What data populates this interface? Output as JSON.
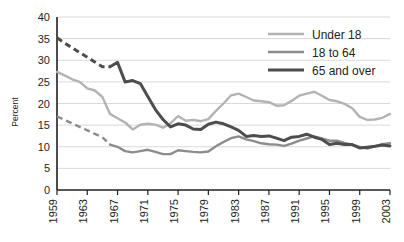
{
  "chart_data": {
    "type": "line",
    "title": "",
    "subtitle": "",
    "xlabel": "",
    "ylabel": "Percent",
    "ylim": [
      0,
      40
    ],
    "ytick_values": [
      0,
      5,
      10,
      15,
      20,
      25,
      30,
      35,
      40
    ],
    "ytick_labels": [
      "0",
      "5",
      "10",
      "15",
      "20",
      "25",
      "30",
      "35",
      "40"
    ],
    "xlim": [
      1959,
      2003
    ],
    "xtick_labels": [
      "1959",
      "1963",
      "1967",
      "1971",
      "1975",
      "1979",
      "1983",
      "1987",
      "1991",
      "1995",
      "1999",
      "2003"
    ],
    "xtick_values": [
      1959,
      1963,
      1967,
      1971,
      1975,
      1979,
      1983,
      1987,
      1991,
      1995,
      1999,
      2003
    ],
    "grid": "horizontal",
    "legend_position": "top-right",
    "x": [
      1959,
      1960,
      1961,
      1962,
      1963,
      1964,
      1965,
      1966,
      1967,
      1968,
      1969,
      1970,
      1971,
      1972,
      1973,
      1974,
      1975,
      1976,
      1977,
      1978,
      1979,
      1980,
      1981,
      1982,
      1983,
      1984,
      1985,
      1986,
      1987,
      1988,
      1989,
      1990,
      1991,
      1992,
      1993,
      1994,
      1995,
      1996,
      1997,
      1998,
      1999,
      2000,
      2001,
      2002,
      2003
    ],
    "series": [
      {
        "name": "Under 18",
        "color": "#b3b3b3",
        "width": 2.4,
        "dashed_from": 1959,
        "dashed_to": 1959,
        "values": [
          27.3,
          26.5,
          25.6,
          25.0,
          23.5,
          23.0,
          21.5,
          17.6,
          16.6,
          15.6,
          14.0,
          15.1,
          15.3,
          15.1,
          14.4,
          15.4,
          17.1,
          16.0,
          16.2,
          15.9,
          16.4,
          18.3,
          20.0,
          21.9,
          22.3,
          21.5,
          20.7,
          20.5,
          20.3,
          19.5,
          19.6,
          20.6,
          21.8,
          22.3,
          22.7,
          21.8,
          20.8,
          20.5,
          19.9,
          18.9,
          16.9,
          16.2,
          16.3,
          16.7,
          17.6
        ]
      },
      {
        "name": "18 to 64",
        "color": "#8c8c8c",
        "width": 2.4,
        "dashed_from": 1959,
        "dashed_to": 1966,
        "values": [
          17.0,
          16.2,
          15.4,
          14.6,
          13.8,
          13.0,
          12.2,
          10.5,
          10.0,
          9.0,
          8.7,
          9.0,
          9.3,
          8.8,
          8.3,
          8.3,
          9.2,
          9.0,
          8.8,
          8.7,
          8.9,
          10.1,
          11.1,
          12.0,
          12.4,
          11.7,
          11.3,
          10.8,
          10.6,
          10.5,
          10.2,
          10.7,
          11.4,
          11.9,
          12.4,
          11.9,
          11.4,
          11.4,
          10.9,
          10.5,
          10.0,
          9.6,
          10.1,
          10.6,
          10.8
        ]
      },
      {
        "name": "65 and over",
        "color": "#4d4d4d",
        "width": 3.0,
        "dashed_from": 1959,
        "dashed_to": 1966,
        "values": [
          35.2,
          34.0,
          32.9,
          31.8,
          30.7,
          29.6,
          28.5,
          28.5,
          29.5,
          25.0,
          25.3,
          24.6,
          21.6,
          18.6,
          16.3,
          14.6,
          15.3,
          15.0,
          14.1,
          14.0,
          15.2,
          15.7,
          15.3,
          14.6,
          13.8,
          12.4,
          12.6,
          12.4,
          12.5,
          12.0,
          11.4,
          12.2,
          12.4,
          12.9,
          12.2,
          11.7,
          10.5,
          10.8,
          10.5,
          10.5,
          9.7,
          9.9,
          10.1,
          10.4,
          10.2
        ]
      }
    ]
  },
  "legend": {
    "items": [
      {
        "label": "Under 18",
        "color": "#b3b3b3"
      },
      {
        "label": "18 to 64",
        "color": "#8c8c8c"
      },
      {
        "label": "65 and over",
        "color": "#4d4d4d"
      }
    ]
  },
  "axes": {
    "y_axis_title": "Percent"
  }
}
